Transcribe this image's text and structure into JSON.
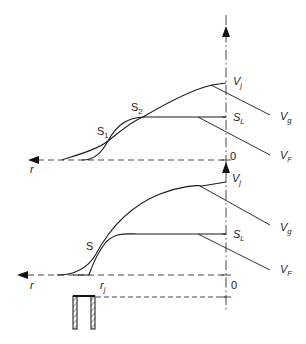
{
  "diagram": {
    "type": "velocity-profile-schematic",
    "axes": {
      "radial_axis_label": "r",
      "origin_label": "0"
    },
    "top_panel": {
      "labels": {
        "jet_velocity": {
          "main": "V",
          "sub": "j"
        },
        "gas_velocity": {
          "main": "V",
          "sub": "g"
        },
        "liquid_level": {
          "main": "S",
          "sub": "L"
        },
        "fluid_velocity": {
          "main": "V",
          "sub": "F"
        },
        "point_s1": {
          "main": "S",
          "sub": "1"
        },
        "point_s2": {
          "main": "S",
          "sub": "2"
        }
      }
    },
    "bottom_panel": {
      "labels": {
        "jet_velocity": {
          "main": "V",
          "sub": "j"
        },
        "gas_velocity": {
          "main": "V",
          "sub": "g"
        },
        "liquid_level": {
          "main": "S",
          "sub": "L"
        },
        "fluid_velocity": {
          "main": "V",
          "sub": "F"
        },
        "point_s": "S",
        "jet_radius": {
          "main": "r",
          "sub": "j"
        }
      },
      "nozzle": "hatched nozzle wall"
    },
    "colors": {
      "line": "#1a1a1a",
      "background": "#ffffff"
    }
  }
}
